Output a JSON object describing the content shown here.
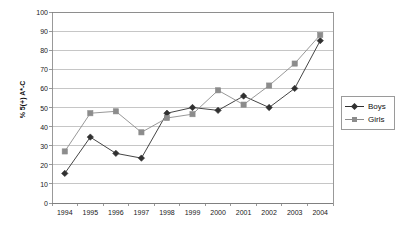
{
  "chart_data": {
    "type": "line",
    "title": "",
    "xlabel": "",
    "ylabel": "% 5(+) A*-C",
    "categories": [
      "1994",
      "1995",
      "1996",
      "1997",
      "1998",
      "1999",
      "2000",
      "2001",
      "2002",
      "2003",
      "2004"
    ],
    "ylim": [
      0,
      100
    ],
    "ytick_step": 10,
    "yticks": [
      0,
      10,
      20,
      30,
      40,
      50,
      60,
      70,
      80,
      90,
      100
    ],
    "grid": "horizontal",
    "legend_position": "right",
    "series": [
      {
        "name": "Boys",
        "color": "#303030",
        "marker": "diamond",
        "values": [
          15.5,
          34.5,
          26,
          23.5,
          47,
          50,
          48.5,
          56,
          50,
          60,
          85
        ]
      },
      {
        "name": "Girls",
        "color": "#8c8c8c",
        "marker": "square",
        "values": [
          27,
          47,
          48,
          37,
          44.5,
          46.5,
          59,
          51.5,
          61.5,
          73,
          88
        ]
      }
    ]
  },
  "legend": {
    "items": [
      {
        "label": "Boys"
      },
      {
        "label": "Girls"
      }
    ]
  },
  "colors": {
    "boys": "#303030",
    "girls": "#8c8c8c",
    "grid": "#b8b8b8",
    "axis": "#808080",
    "text": "#202020",
    "background": "#ffffff"
  }
}
